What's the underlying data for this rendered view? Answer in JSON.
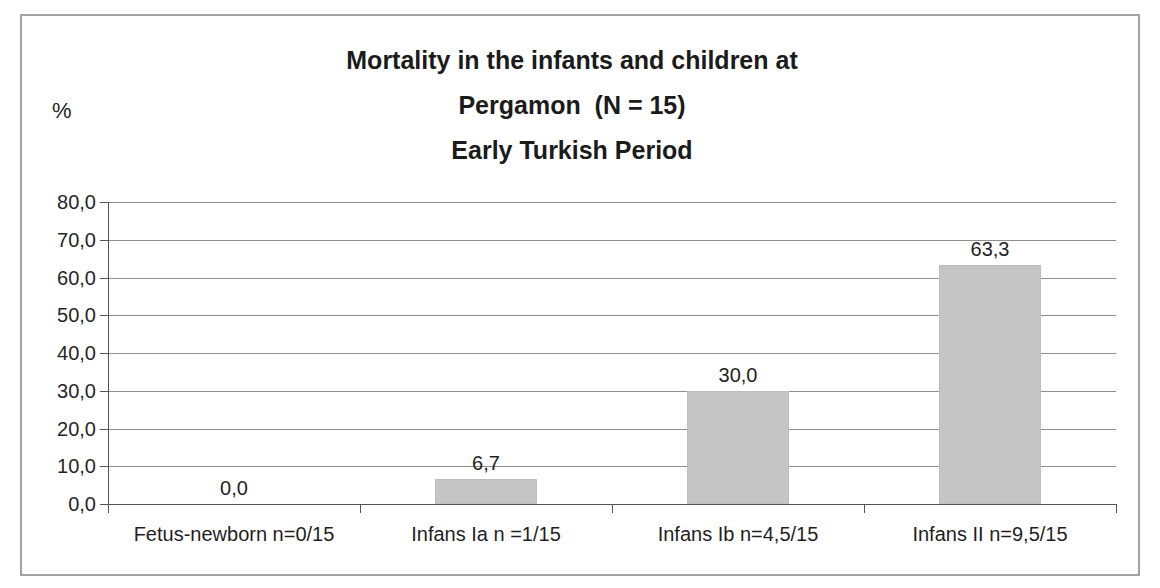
{
  "chart_data": {
    "type": "bar",
    "title": "Mortality in the infants and children at Pergamon (N = 15) Early Turkish Period",
    "title_lines": [
      "Mortality in the infants and children at",
      "Pergamon  (N = 15)",
      "Early Turkish Period"
    ],
    "ylabel": "%",
    "xlabel": "",
    "categories": [
      "Fetus-newborn n=0/15",
      "Infans Ia n =1/15",
      "Infans Ib n=4,5/15",
      "Infans II n=9,5/15"
    ],
    "values": [
      0.0,
      6.7,
      30.0,
      63.3
    ],
    "data_labels": [
      "0,0",
      "6,7",
      "30,0",
      "63,3"
    ],
    "y_tick_values": [
      80,
      70,
      60,
      50,
      40,
      30,
      20,
      10,
      0
    ],
    "y_tick_labels": [
      "80,0",
      "70,0",
      "60,0",
      "50,0",
      "40,0",
      "30,0",
      "20,0",
      "10,0",
      "0,0"
    ],
    "ylim": [
      0,
      80
    ],
    "grid": "horizontal",
    "legend_position": "none",
    "decimal_separator": ",",
    "colors": {
      "bar_fill": "#c5c5c5",
      "bar_border": "#bdbdbd",
      "grid_line": "#8f8f8f",
      "axis_line": "#555555",
      "frame_border": "#a3a3a3",
      "text": "#1f1f1f",
      "background": "#ffffff"
    }
  }
}
